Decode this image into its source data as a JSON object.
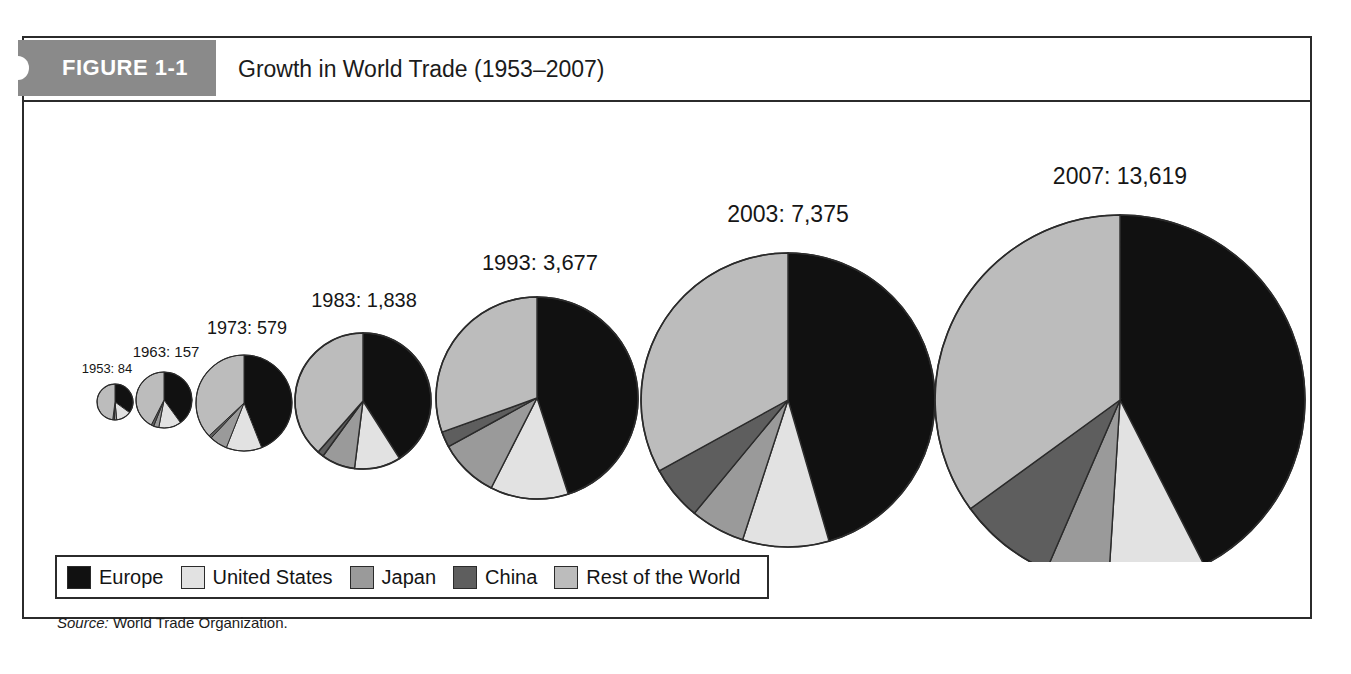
{
  "figure": {
    "tab_label": "FIGURE 1-1",
    "title": "Growth in World Trade (1953–2007)",
    "source_label": "Source:",
    "source_text": "World Trade Organization."
  },
  "legend": {
    "items": [
      {
        "label": "Europe",
        "color": "#111111"
      },
      {
        "label": "United States",
        "color": "#e2e2e2"
      },
      {
        "label": "Japan",
        "color": "#9a9a9a"
      },
      {
        "label": "China",
        "color": "#5e5e5e"
      },
      {
        "label": "Rest of the World",
        "color": "#bcbcbc"
      }
    ]
  },
  "chart_data": {
    "type": "pie",
    "title": "Growth in World Trade (1953–2007)",
    "subtitle": "",
    "xlabel": "",
    "ylabel": "",
    "value_unit": "billions of US dollars",
    "note": "Pie area proportional to total world merchandise exports; each pie shows share by region.",
    "legend_position": "bottom-left",
    "grid": false,
    "series_names": [
      "Europe",
      "United States",
      "Japan",
      "China",
      "Rest of the World"
    ],
    "series_colors": [
      "#111111",
      "#e2e2e2",
      "#9a9a9a",
      "#5e5e5e",
      "#bcbcbc"
    ],
    "pies": [
      {
        "year": "1953",
        "total": 84,
        "label": "1953: 84",
        "cx": 91,
        "cy": 300,
        "r": 18,
        "label_x": 83,
        "label_y": 271,
        "label_size": 13,
        "shares": [
          35.0,
          13.5,
          2.0,
          1.5,
          48.0
        ]
      },
      {
        "year": "1963",
        "total": 157,
        "label": "1963: 157",
        "cx": 140,
        "cy": 298,
        "r": 28,
        "label_x": 142,
        "label_y": 255,
        "label_size": 15,
        "shares": [
          40.0,
          13.0,
          3.0,
          1.5,
          42.5
        ]
      },
      {
        "year": "1973",
        "total": 579,
        "label": "1973: 579",
        "cx": 220,
        "cy": 301,
        "r": 48,
        "label_x": 223,
        "label_y": 232,
        "label_size": 18,
        "shares": [
          44.0,
          12.0,
          6.0,
          1.0,
          37.0
        ]
      },
      {
        "year": "1983",
        "total": 1838,
        "label": "1983: 1,838",
        "cx": 339,
        "cy": 299,
        "r": 68,
        "label_x": 340,
        "label_y": 205,
        "label_size": 20,
        "shares": [
          41.0,
          11.0,
          8.0,
          1.5,
          38.5
        ]
      },
      {
        "year": "1993",
        "total": 3677,
        "label": "1993: 3,677",
        "cx": 513,
        "cy": 296,
        "r": 101,
        "label_x": 516,
        "label_y": 168,
        "label_size": 22,
        "shares": [
          45.0,
          12.5,
          9.5,
          2.5,
          30.5
        ]
      },
      {
        "year": "2003",
        "total": 7375,
        "label": "2003: 7,375",
        "cx": 764,
        "cy": 298,
        "r": 147,
        "label_x": 764,
        "label_y": 120,
        "label_size": 23,
        "shares": [
          45.5,
          9.5,
          6.0,
          6.0,
          33.0
        ]
      },
      {
        "year": "2007",
        "total": 13619,
        "label": "2007: 13,619",
        "cx": 1096,
        "cy": 298,
        "r": 185,
        "label_x": 1096,
        "label_y": 82,
        "label_size": 23,
        "shares": [
          42.5,
          8.5,
          5.5,
          8.5,
          35.0
        ]
      }
    ]
  }
}
